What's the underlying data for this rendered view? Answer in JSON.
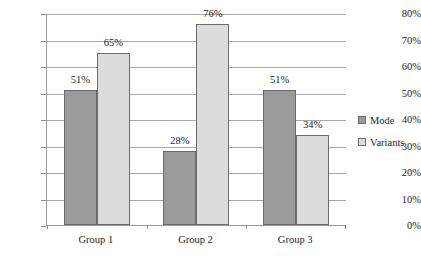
{
  "chart_data": {
    "type": "bar",
    "title": "",
    "subtitle": "",
    "xlabel": "",
    "ylabel": "",
    "categories": [
      "Group 1",
      "Group 2",
      "Group 3"
    ],
    "series": [
      {
        "name": "Mode",
        "color": "#9b9b9b",
        "values": [
          51,
          28,
          51
        ],
        "labels": [
          "51%",
          "28%",
          "51%"
        ]
      },
      {
        "name": "Variants",
        "color": "#dcdcdc",
        "values": [
          65,
          76,
          34
        ],
        "labels": [
          "65%",
          "76%",
          "34%"
        ]
      }
    ],
    "ylim": [
      0,
      80
    ],
    "ytick_values": [
      0,
      10,
      20,
      30,
      40,
      50,
      60,
      70,
      80
    ],
    "ytick_labels": [
      "0%",
      "10%",
      "20%",
      "30%",
      "40%",
      "50%",
      "60%",
      "70%",
      "80%"
    ],
    "grid": true,
    "legend_position": "right",
    "value_labels": true,
    "unit": "%"
  }
}
